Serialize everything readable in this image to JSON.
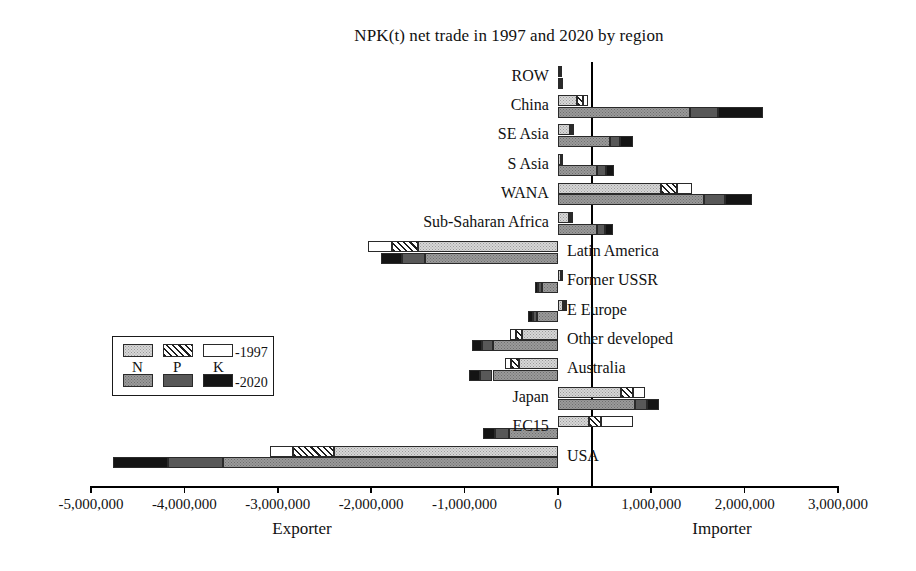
{
  "chart_data": {
    "type": "bar",
    "orientation": "horizontal",
    "stacked": true,
    "title": "NPK(t) net trade in 1997 and 2020 by region",
    "xlabel": "",
    "ylabel": "",
    "xlim": [
      -5000000,
      3000000
    ],
    "xticks": [
      -5000000,
      -4000000,
      -3000000,
      -2000000,
      -1000000,
      0,
      1000000,
      2000000,
      3000000
    ],
    "xtick_labels": [
      "-5,000,000",
      "-4,000,000",
      "-3,000,000",
      "-2,000,000",
      "-1,000,000",
      "0",
      "1,000,000",
      "2,000,000",
      "3,000,000"
    ],
    "grid": false,
    "legend_position": "center-left",
    "axis_captions": {
      "negative": "Exporter",
      "positive": "Importer"
    },
    "nutrients": [
      "N",
      "P",
      "K"
    ],
    "years": [
      "1997",
      "2020"
    ],
    "categories": [
      "ROW",
      "China",
      "SE Asia",
      "S Asia",
      "WANA",
      "Sub-Saharan Africa",
      "Latin America",
      "Former USSR",
      "E Europe",
      "Other developed",
      "Australia",
      "Japan",
      "EC15",
      "USA"
    ],
    "series": [
      {
        "name": "1997 N",
        "values": [
          20000,
          210000,
          130000,
          30000,
          1100000,
          120000,
          -1500000,
          30000,
          60000,
          -380000,
          -420000,
          680000,
          330000,
          -2400000
        ]
      },
      {
        "name": "1997 P",
        "values": [
          6000,
          60000,
          25000,
          6000,
          180000,
          20000,
          -280000,
          6000,
          12000,
          -70000,
          -80000,
          120000,
          130000,
          -440000
        ]
      },
      {
        "name": "1997 K",
        "values": [
          5000,
          55000,
          20000,
          5000,
          160000,
          18000,
          -250000,
          5000,
          10000,
          -60000,
          -70000,
          130000,
          340000,
          -240000
        ]
      },
      {
        "name": "2020 N",
        "values": [
          22000,
          1420000,
          560000,
          420000,
          1560000,
          420000,
          -1420000,
          -170000,
          -220000,
          -690000,
          -700000,
          830000,
          -520000,
          -3590000
        ]
      },
      {
        "name": "2020 P",
        "values": [
          7000,
          290000,
          110000,
          95000,
          230000,
          80000,
          -250000,
          -40000,
          -50000,
          -120000,
          -130000,
          120000,
          -150000,
          -590000
        ]
      },
      {
        "name": "2020 K",
        "values": [
          6000,
          490000,
          130000,
          85000,
          290000,
          90000,
          -220000,
          -35000,
          -45000,
          -110000,
          -120000,
          130000,
          -130000,
          -580000
        ]
      }
    ],
    "row_totals_1997": [
      31000,
      325000,
      175000,
      41000,
      1440000,
      158000,
      -2030000,
      41000,
      82000,
      -510000,
      -570000,
      930000,
      800000,
      -3080000
    ],
    "row_totals_2020": [
      35000,
      2200000,
      800000,
      600000,
      2080000,
      590000,
      -1890000,
      -245000,
      -315000,
      -920000,
      -950000,
      1080000,
      -800000,
      -4760000
    ],
    "label_side": [
      "left",
      "left",
      "left",
      "left",
      "left",
      "left",
      "right",
      "right",
      "right",
      "right",
      "right",
      "left",
      "left",
      "right"
    ]
  },
  "legend": {
    "letters": [
      "N",
      "P",
      "K"
    ],
    "row_1997_label": "-1997",
    "row_2020_label": "-2020",
    "swatches_1997": [
      "legend-n-1997",
      "legend-p-1997",
      "legend-k-1997"
    ],
    "swatches_2020": [
      "legend-n-2020",
      "legend-p-2020",
      "legend-k-2020"
    ]
  },
  "colors": {
    "n_1997": "#d7d7d7",
    "p_1997": "#f2f2f2",
    "k_1997": "#ffffff",
    "n_2020": "#9a9a9a",
    "p_2020": "#585858",
    "k_2020": "#141414",
    "axis": "#000000",
    "background": "#ffffff"
  }
}
